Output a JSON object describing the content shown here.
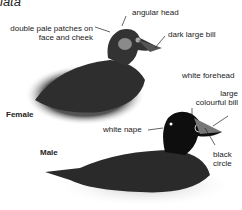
{
  "title": "iata",
  "female": {
    "label": "Female",
    "annotations": {
      "angular_head": "angular head",
      "pale_patches_line1": "double pale patches on",
      "pale_patches_line2": "face and cheek",
      "dark_bill": "dark large bill"
    }
  },
  "male": {
    "label": "Male",
    "annotations": {
      "white_forehead": "white forehead",
      "bill_line1": "large",
      "bill_line2": "colourful bill",
      "white_nape": "white nape",
      "circle_line1": "black",
      "circle_line2": "circle"
    }
  }
}
